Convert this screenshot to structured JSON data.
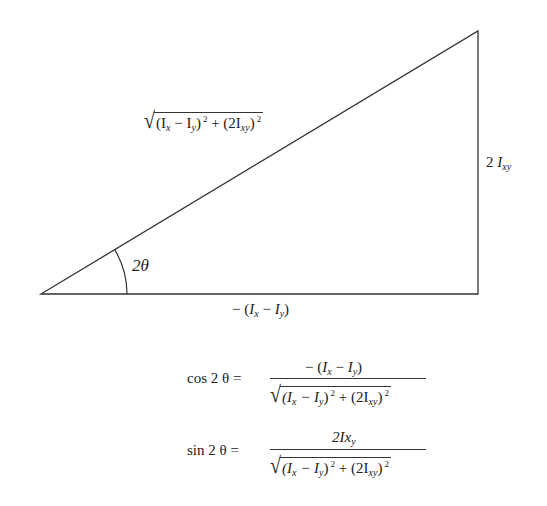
{
  "diagram": {
    "type": "right-triangle",
    "vertices": {
      "angle_vertex": [
        41,
        294
      ],
      "right_angle_vertex": [
        478,
        294
      ],
      "top_vertex": [
        478,
        31
      ]
    },
    "angle_label": "2θ",
    "labels": {
      "hypotenuse": {
        "radicand_part1": "(I",
        "radicand_sub1": "x",
        "radicand_part2": " − I",
        "radicand_sub2": "y",
        "radicand_part3": ")",
        "radicand_exp1": "2",
        "radicand_part4": " + (2I",
        "radicand_sub3": "xy",
        "radicand_part5": ")",
        "radicand_exp2": "2"
      },
      "opposite": {
        "coef": "2 ",
        "var": "I",
        "sub": "xy"
      },
      "adjacent": {
        "prefix": "− (",
        "var1": "I",
        "sub1": "x",
        "mid": " − ",
        "var2": "I",
        "sub2": "y",
        "suffix": ")"
      }
    }
  },
  "equations": [
    {
      "lhs": "cos 2 θ =",
      "numerator": {
        "prefix": "− (",
        "var1": "I",
        "sub1": "x",
        "mid": " − ",
        "var2": "I",
        "sub2": "y",
        "suffix": ")"
      },
      "denominator": {
        "p1": "(I",
        "s1": "x",
        "p2": " − I",
        "s2": "y",
        "p3": ")",
        "e1": "2",
        "p4": " + (2I",
        "s3": "xy",
        "p5": ")",
        "e2": "2"
      }
    },
    {
      "lhs": "sin 2 θ =",
      "numerator": {
        "prefix": "2I",
        "mid": "x",
        "sub": "y"
      },
      "denominator": {
        "p1": "(I",
        "s1": "x",
        "p2": " − I",
        "s2": "y",
        "p3": ")",
        "e1": "2",
        "p4": " + (2I",
        "s3": "xy",
        "p5": ")",
        "e2": "2"
      }
    }
  ]
}
